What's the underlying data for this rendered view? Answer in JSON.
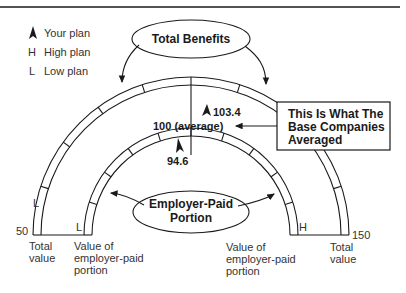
{
  "legend": {
    "items": [
      {
        "symbol": "▲",
        "icon": "your-plan-marker-icon",
        "label": "Your plan"
      },
      {
        "symbol": "H",
        "icon": "high-plan-marker",
        "label": "High plan"
      },
      {
        "symbol": "L",
        "icon": "low-plan-marker",
        "label": "Low plan"
      }
    ]
  },
  "callouts": {
    "total_benefits": "Total Benefits",
    "employer_paid_line1": "Employer-Paid",
    "employer_paid_line2": "Portion",
    "base_companies_line1": "This Is What The",
    "base_companies_line2": "Base Companies",
    "base_companies_line3": "Averaged"
  },
  "scale": {
    "min": "50",
    "max": "150",
    "average_label": "100 (average)"
  },
  "outer_arc": {
    "your_plan_value": "103.4",
    "low_marker": "L",
    "high_marker": "H",
    "left_caption_line1": "Total",
    "left_caption_line2": "value",
    "right_caption_line1": "Total",
    "right_caption_line2": "value"
  },
  "inner_arc": {
    "your_plan_value": "94.6",
    "low_marker": "L",
    "high_marker": "H",
    "left_caption_line1": "Value of",
    "left_caption_line2": "employer-paid",
    "left_caption_line3": "portion",
    "right_caption_line1": "Value of",
    "right_caption_line2": "employer-paid",
    "right_caption_line3": "portion"
  }
}
